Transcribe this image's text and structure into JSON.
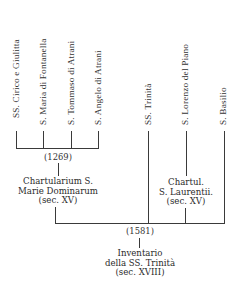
{
  "sources": [
    {
      "label": "SS. Cirico e Giulitta"
    },
    {
      "label": "S. Maria di Fontanella"
    },
    {
      "label": "S. Tommaso di Atrani"
    },
    {
      "label": "S. Angelo di Atrani"
    },
    {
      "label": "SS. Trinità"
    },
    {
      "label": "S. Lorenzo del Piano"
    },
    {
      "label": "S. Basilio"
    }
  ],
  "group_left": {
    "date": "(1269)",
    "title_line1": "Chartularium S.",
    "title_line2": "Marie Dominarum",
    "title_line3": "(sec. XV)"
  },
  "group_right": {
    "title_line1": "Chartul.",
    "title_line2": "S. Laurentii.",
    "title_line3": "(sec. XV)"
  },
  "final": {
    "date": "(1581)",
    "title_line1": "Inventario",
    "title_line2": "della SS. Trinità",
    "title_line3": "(sec. XVIII)"
  }
}
